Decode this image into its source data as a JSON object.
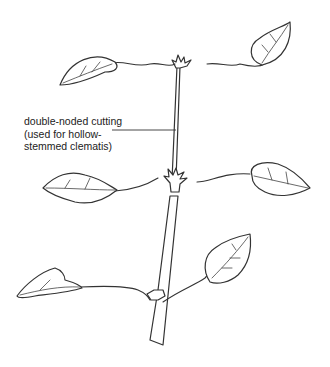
{
  "diagram": {
    "label": {
      "lines": [
        "double-noded cutting",
        "(used for hollow-",
        "stemmed clematis)"
      ]
    },
    "colors": {
      "line": "#333333",
      "background": "#ffffff",
      "text": "#222222"
    }
  }
}
